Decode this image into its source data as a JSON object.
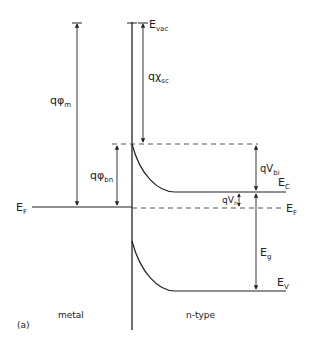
{
  "diagram": {
    "type": "energy-band-diagram",
    "panel_label": "(a)",
    "regions": {
      "left": "metal",
      "right": "n-type"
    },
    "labels": {
      "evac": {
        "main": "E",
        "sub": "vac"
      },
      "q_phi_m": {
        "main": "qφ",
        "sub": "m"
      },
      "q_chi_sc": {
        "main": "qχ",
        "sub": "sc"
      },
      "q_phi_bn": {
        "main": "qφ",
        "sub": "bn"
      },
      "q_v_bi": {
        "main": "qV",
        "sub": "bi"
      },
      "q_v_n": {
        "main": "qV",
        "sub": "n"
      },
      "ef_left": {
        "main": "E",
        "sub": "F"
      },
      "ef_right": {
        "main": "E",
        "sub": "F"
      },
      "ec": {
        "main": "E",
        "sub": "C"
      },
      "ev": {
        "main": "E",
        "sub": "V"
      },
      "eg": {
        "main": "E",
        "sub": "g"
      }
    },
    "colors": {
      "line": "#222222",
      "dashed": "#555555",
      "background": "#ffffff"
    }
  }
}
